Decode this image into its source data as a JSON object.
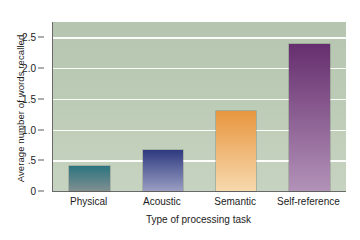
{
  "chart_data": {
    "type": "bar",
    "title": "",
    "xlabel": "Type of processing task",
    "ylabel": "Average number of words recalled",
    "categories": [
      "Physical",
      "Acoustic",
      "Semantic",
      "Self-reference"
    ],
    "values": [
      0.4,
      0.67,
      1.3,
      2.4
    ],
    "ylim": [
      0,
      2.75
    ],
    "yticks": [
      "0",
      ".5",
      "1.0",
      "1.5",
      "2.0",
      "2.5"
    ],
    "ytick_values": [
      0,
      0.5,
      1.0,
      1.5,
      2.0,
      2.5
    ],
    "grid": true,
    "legend": "none",
    "plot_background": "#bccbb6",
    "gridline_color": "#fbfdfa",
    "axis_color": "#6a6a6a",
    "bar_colors": [
      {
        "name": "Physical",
        "top": "#2c7480",
        "bottom": "#7f8f90"
      },
      {
        "name": "Acoustic",
        "top": "#2e3a80",
        "bottom": "#9a9ec2"
      },
      {
        "name": "Semantic",
        "top": "#e8963f",
        "bottom": "#f7d9ae"
      },
      {
        "name": "Self-reference",
        "top": "#662e6e",
        "bottom": "#b292b8"
      }
    ]
  }
}
